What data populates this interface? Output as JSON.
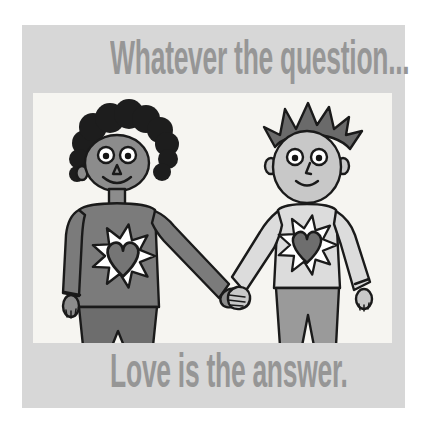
{
  "poster": {
    "top_caption": "Whatever the question...",
    "bottom_caption": "Love is the answer.",
    "colors": {
      "page_background": "#ffffff",
      "card_background": "#d7d7d7",
      "panel_background": "#f6f5f1",
      "caption_text": "#969696",
      "outline": "#1a1a1a",
      "star_fill": "#ffffff",
      "eye_white": "#ffffff",
      "pupil": "#141414"
    },
    "illustration": {
      "description": "Two smiling cartoon boys holding hands; each wears a sweater with a heart inside a white starburst on the chest",
      "left_boy": {
        "hair_style": "curly",
        "skin": "#8c8c8c",
        "hair": "#1d1d1d",
        "sweater": "#7b7b7b",
        "pants": "#6d6d6d",
        "heart": "#757575"
      },
      "right_boy": {
        "hair_style": "spiky",
        "skin": "#c8c8c8",
        "hair": "#6a6a6a",
        "sweater": "#dcdcdc",
        "pants": "#9a9a9a",
        "heart": "#6e6e6e"
      }
    }
  }
}
